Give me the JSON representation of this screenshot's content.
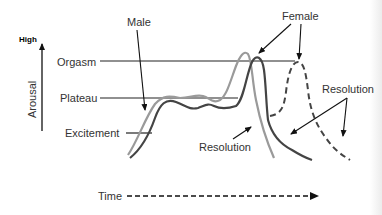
{
  "diagram": {
    "y_axis": {
      "label": "Arousal",
      "top_label": "High"
    },
    "x_axis": {
      "label": "Time"
    },
    "stages": [
      "Orgasm",
      "Plateau",
      "Excitement"
    ],
    "curves": [
      {
        "name": "Male",
        "color": "#999999",
        "style": "solid"
      },
      {
        "name": "Female",
        "color": "#444444",
        "style": "solid"
      },
      {
        "name": "Female (multiple orgasm)",
        "color": "#444444",
        "style": "dashed"
      }
    ],
    "annotations": {
      "male": "Male",
      "female": "Female",
      "resolution_center": "Resolution",
      "resolution_right": "Resolution"
    }
  }
}
